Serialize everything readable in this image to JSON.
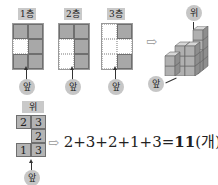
{
  "floors": [
    {
      "label": "1층",
      "front_label": "앞",
      "cells": [
        [
          1,
          1
        ],
        [
          0,
          1
        ],
        [
          1,
          1
        ]
      ]
    },
    {
      "label": "2층",
      "front_label": "앞",
      "cells": [
        [
          1,
          1
        ],
        [
          0,
          1
        ],
        [
          0,
          1
        ]
      ]
    },
    {
      "label": "3층",
      "front_label": "앞",
      "cells": [
        [
          0,
          1
        ],
        [
          0,
          0
        ],
        [
          0,
          1
        ]
      ]
    }
  ],
  "isometric": {
    "top_label": "위",
    "front_label": "앞",
    "arrow": "⇨"
  },
  "top_view": {
    "top_label": "위",
    "front_label": "앞",
    "cells": [
      [
        "2",
        "3"
      ],
      [
        "",
        "2"
      ],
      [
        "1",
        "3"
      ]
    ]
  },
  "formula": {
    "arrow": "⇨",
    "expression": "2+3+2+1+3=",
    "result": "11",
    "unit": "(개)"
  },
  "colors": {
    "filled": "#a8a8a8",
    "label_bg": "#c9c9c9"
  }
}
